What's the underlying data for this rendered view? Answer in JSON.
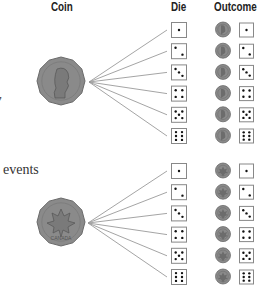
{
  "headers": {
    "coin": "Coin",
    "die": "Die",
    "outcome": "Outcome"
  },
  "side_text": {
    "fragment_top": "y",
    "fragment_bottom": "events"
  },
  "colors": {
    "coin_fill": "#8a8a8a",
    "coin_stroke": "#6a6a6a",
    "line": "#9a9a9a",
    "die_border": "#888888",
    "pip": "#111111"
  },
  "branches": [
    {
      "coin_side": "heads",
      "coin_label": "Queen portrait",
      "die_faces": [
        1,
        2,
        3,
        4,
        5,
        6
      ],
      "outcomes": [
        {
          "coin": "heads",
          "die": 1
        },
        {
          "coin": "heads",
          "die": 2
        },
        {
          "coin": "heads",
          "die": 3
        },
        {
          "coin": "heads",
          "die": 4
        },
        {
          "coin": "heads",
          "die": 5
        },
        {
          "coin": "heads",
          "die": 6
        }
      ]
    },
    {
      "coin_side": "tails",
      "coin_label": "CANADA",
      "die_faces": [
        1,
        2,
        3,
        4,
        5,
        6
      ],
      "outcomes": [
        {
          "coin": "tails",
          "die": 1
        },
        {
          "coin": "tails",
          "die": 2
        },
        {
          "coin": "tails",
          "die": 3
        },
        {
          "coin": "tails",
          "die": 4
        },
        {
          "coin": "tails",
          "die": 5
        },
        {
          "coin": "tails",
          "die": 6
        }
      ]
    }
  ]
}
